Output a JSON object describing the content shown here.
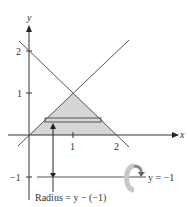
{
  "diagram": {
    "axes": {
      "x_label": "x",
      "y_label": "y"
    },
    "y_ticks": [
      "2",
      "1",
      "−1"
    ],
    "x_ticks": [
      "1",
      "2"
    ],
    "lines": [
      {
        "equation": "y = x"
      },
      {
        "equation": "y = 2 − x"
      }
    ],
    "shaded_region": "triangle with vertices (0,0), (1,1), (2,0)",
    "axis_of_revolution": {
      "label": "y = −1",
      "icon": "rotation-arrow-icon"
    },
    "radius_label": "Radius = y − (−1)",
    "colors": {
      "shade": "#d6d6d6",
      "line": "#555555",
      "axis": "#333333"
    }
  }
}
